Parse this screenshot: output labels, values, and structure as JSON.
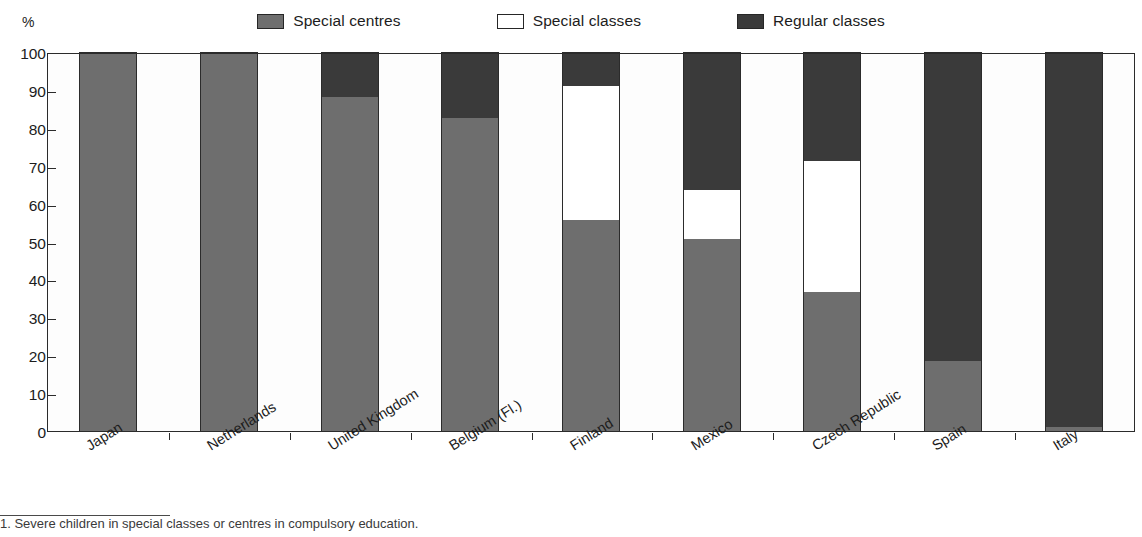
{
  "axis": {
    "unit_label": "%",
    "y_ticks": [
      0,
      10,
      20,
      30,
      40,
      50,
      60,
      70,
      80,
      90,
      100
    ]
  },
  "legend": {
    "items": [
      {
        "label": "Special centres",
        "swatch": "legend-swatch-special-centres",
        "color": "#6e6e6e"
      },
      {
        "label": "Special classes",
        "swatch": "legend-swatch-special-classes",
        "color": "#ffffff"
      },
      {
        "label": "Regular classes",
        "swatch": "legend-swatch-regular-classes",
        "color": "#3a3a3a"
      }
    ]
  },
  "footnote": {
    "text": "1. Severe children in special classes or centres in compulsory education."
  },
  "chart_data": {
    "type": "bar",
    "subtype": "stacked-bar-100-percent",
    "title": "",
    "subtitle": "",
    "xlabel": "",
    "ylabel": "%",
    "ylim": [
      0,
      100
    ],
    "yticks": [
      0,
      10,
      20,
      30,
      40,
      50,
      60,
      70,
      80,
      90,
      100
    ],
    "grid": false,
    "legend_position": "top-center",
    "categories": [
      "Japan",
      "Netherlands",
      "United Kingdom",
      "Belgium (Fl.)",
      "Finland",
      "Mexico",
      "Czech Republic",
      "Spain",
      "Italy"
    ],
    "series": [
      {
        "name": "Special centres",
        "color": "#6e6e6e",
        "values": [
          100,
          100,
          88.5,
          83,
          56,
          51,
          37,
          18.5,
          1
        ]
      },
      {
        "name": "Special classes",
        "color": "#ffffff",
        "values": [
          0,
          0,
          0,
          0,
          35.5,
          13,
          34.5,
          0,
          0
        ]
      },
      {
        "name": "Regular classes",
        "color": "#3a3a3a",
        "values": [
          0,
          0,
          11.5,
          17,
          8.5,
          36,
          28.5,
          81.5,
          99
        ]
      }
    ]
  }
}
